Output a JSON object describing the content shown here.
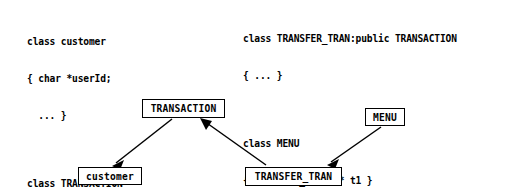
{
  "diagram": {
    "type": "uml-class-diagram",
    "code_blocks": [
      {
        "id": "left",
        "name": "left-code-block",
        "groups": [
          {
            "lines": [
              "class customer",
              "{ char *userId;",
              "  ... }"
            ]
          },
          {
            "lines": [
              "class TRANSACTION",
              "{ TRANSACTION(customer*)...}"
            ]
          }
        ]
      },
      {
        "id": "right",
        "name": "right-code-block",
        "groups": [
          {
            "lines": [
              "class TRANSFER_TRAN:public TRANSACTION",
              "{ ... }"
            ]
          },
          {
            "lines": [
              "class MENU",
              "{ TRANSFER_TRAN  * t1 }"
            ]
          }
        ]
      }
    ],
    "nodes": [
      {
        "id": "transaction",
        "label": "TRANSACTION"
      },
      {
        "id": "menu",
        "label": "MENU"
      },
      {
        "id": "customer",
        "label": "customer"
      },
      {
        "id": "transfer_tran",
        "label": "TRANSFER_TRAN"
      }
    ],
    "edges": [
      {
        "id": "transaction-to-customer",
        "from": "transaction",
        "to": "customer",
        "kind": "association",
        "arrowhead": "open"
      },
      {
        "id": "transfer-tran-to-transaction",
        "from": "transfer_tran",
        "to": "transaction",
        "kind": "inheritance",
        "arrowhead": "open"
      },
      {
        "id": "menu-to-transfer-tran",
        "from": "menu",
        "to": "transfer_tran",
        "kind": "association",
        "arrowhead": "open"
      }
    ],
    "colors": {
      "background": "#ffffff",
      "stroke": "#000000",
      "text": "#000000"
    }
  }
}
